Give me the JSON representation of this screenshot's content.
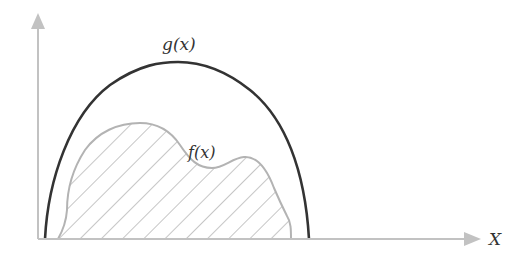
{
  "diagram": {
    "labels": {
      "g": "g(x)",
      "f": "f(x)",
      "x_axis": "X"
    },
    "curves": [
      {
        "name": "g(x)",
        "description": "outer bell-shaped arch curve, dark stroke",
        "color": "#333333"
      },
      {
        "name": "f(x)",
        "description": "inner bimodal curve with hatched region beneath, light gray stroke",
        "color": "#b5b5b5",
        "fill": "diagonal hatching"
      }
    ],
    "axes": {
      "x": {
        "label": "X",
        "arrow": true,
        "color": "#bdbdbd"
      },
      "y": {
        "label": "",
        "arrow": true,
        "color": "#bdbdbd"
      }
    }
  }
}
